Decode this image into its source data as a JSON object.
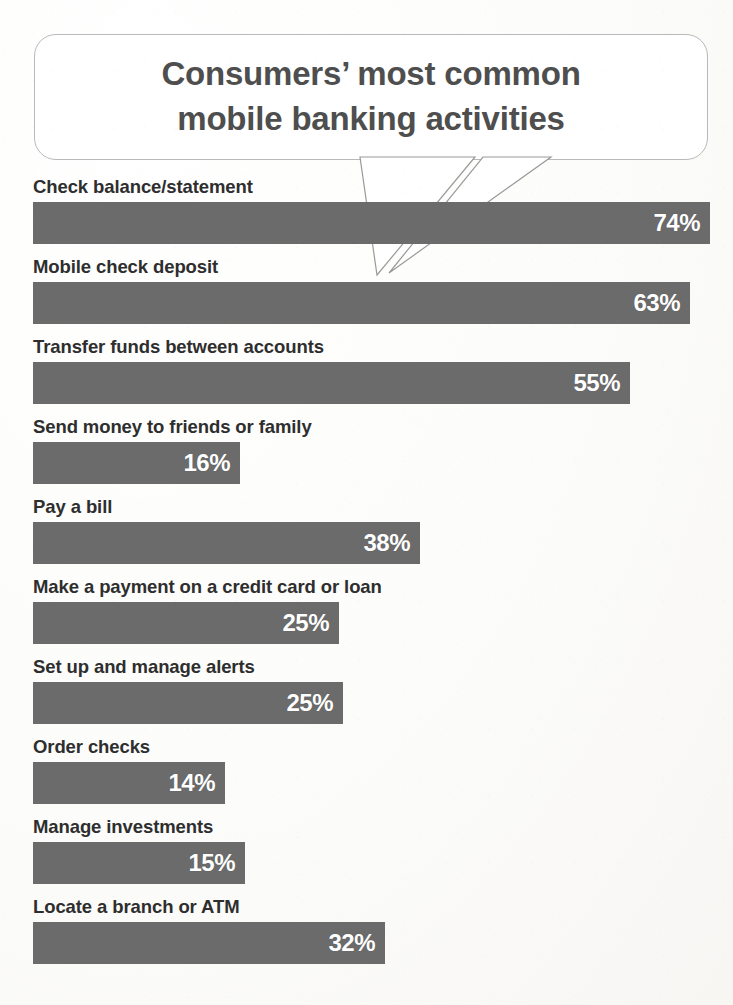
{
  "callout": {
    "title": "Consumers’ most common\nmobile banking activities",
    "tail_label": "callout-tail"
  },
  "colors": {
    "bar": "#6b6b6b",
    "bar_value_text": "#ffffff",
    "label_text": "#2e2e2e",
    "title_text": "#4e4e4e",
    "background": "#fdfdfb",
    "callout_border": "#b9b9b9"
  },
  "chart_data": {
    "type": "bar",
    "orientation": "horizontal",
    "title": "Consumers’ most common mobile banking activities",
    "xlabel": "",
    "ylabel": "",
    "grid": false,
    "legend": null,
    "value_suffix": "%",
    "categories": [
      "Check balance/statement",
      "Mobile check deposit",
      "Transfer funds between accounts",
      "Send money to friends or family",
      "Pay a bill",
      "Make a payment on a credit card or loan",
      "Set up and manage alerts",
      "Order checks",
      "Manage investments",
      "Locate a branch or ATM"
    ],
    "values": [
      74,
      63,
      55,
      16,
      38,
      25,
      25,
      14,
      15,
      32
    ],
    "value_labels": [
      "74%",
      "63%",
      "55%",
      "16%",
      "38%",
      "25%",
      "25%",
      "14%",
      "15%",
      "32%"
    ],
    "bar_pixel_widths": [
      677,
      657,
      597,
      207,
      387,
      306,
      310,
      192,
      212,
      352
    ],
    "xlim": [
      0,
      74
    ]
  },
  "rows": [
    {
      "label": "Check balance/statement",
      "value_label": "74%",
      "width_px": 677
    },
    {
      "label": "Mobile check deposit",
      "value_label": "63%",
      "width_px": 657
    },
    {
      "label": "Transfer funds between accounts",
      "value_label": "55%",
      "width_px": 597
    },
    {
      "label": "Send money to friends or family",
      "value_label": "16%",
      "width_px": 207
    },
    {
      "label": "Pay a bill",
      "value_label": "38%",
      "width_px": 387
    },
    {
      "label": "Make a payment on a credit card or loan",
      "value_label": "25%",
      "width_px": 306
    },
    {
      "label": "Set up and manage alerts",
      "value_label": "25%",
      "width_px": 310
    },
    {
      "label": "Order checks",
      "value_label": "14%",
      "width_px": 192
    },
    {
      "label": "Manage investments",
      "value_label": "15%",
      "width_px": 212
    },
    {
      "label": "Locate a branch or ATM",
      "value_label": "32%",
      "width_px": 352
    }
  ]
}
